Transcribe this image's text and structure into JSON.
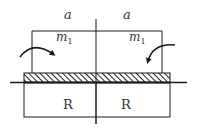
{
  "diagram": {
    "labels": {
      "span_left": "a",
      "span_right": "a",
      "moment_left": "m",
      "moment_left_sub": "1",
      "moment_right": "m",
      "moment_right_sub": "1",
      "block_left": "R",
      "block_right": "R"
    },
    "colors": {
      "line": "#1a1a1a",
      "hatch": "#222222",
      "text": "#333333"
    }
  }
}
